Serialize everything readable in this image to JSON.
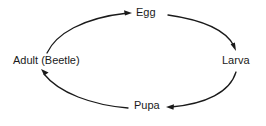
{
  "diagram": {
    "type": "cycle-diagram",
    "direction": "clockwise",
    "stroke_color": "#1a1a1a",
    "background_color": "#ffffff",
    "nodes": [
      {
        "id": "egg",
        "label": "Egg",
        "position": "top"
      },
      {
        "id": "larva",
        "label": "Larva",
        "position": "right"
      },
      {
        "id": "pupa",
        "label": "Pupa",
        "position": "bottom"
      },
      {
        "id": "adult",
        "label": "Adult (Beetle)",
        "position": "left"
      }
    ],
    "arrows": [
      {
        "id": "adult-to-egg",
        "from": "Adult (Beetle)",
        "to": "Egg",
        "head_direction": "right"
      },
      {
        "id": "egg-to-larva",
        "from": "Egg",
        "to": "Larva",
        "head_direction": "down"
      },
      {
        "id": "larva-to-pupa",
        "from": "Larva",
        "to": "Pupa",
        "head_direction": "left"
      },
      {
        "id": "pupa-to-adult",
        "from": "Pupa",
        "to": "Adult (Beetle)",
        "head_direction": "up-left"
      }
    ]
  }
}
